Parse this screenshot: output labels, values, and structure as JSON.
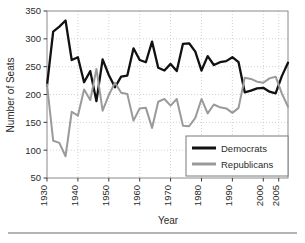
{
  "figure": {
    "plot_left": 47,
    "plot_right": 288,
    "plot_top": 11,
    "plot_bottom": 178,
    "frame_color": "#8a8a8a",
    "grid_color": "#c8c8c8",
    "background": "#ffffff",
    "footer_rule_color": "#6b6b6b"
  },
  "legend": {
    "position": "bottom-right",
    "box_color": "#7a7a7a",
    "entries": [
      {
        "label": "Democrats",
        "color": "#111111",
        "swatch": "line-swatch-democrats"
      },
      {
        "label": "Republicans",
        "color": "#9a9a9a",
        "swatch": "line-swatch-republicans"
      }
    ]
  },
  "chart_data": {
    "type": "line",
    "title": "",
    "xlabel": "Year",
    "ylabel": "Number of Seats",
    "xlim": [
      1930,
      2008
    ],
    "ylim": [
      50,
      350
    ],
    "ytick_step": 50,
    "yticks": [
      50,
      100,
      150,
      200,
      250,
      300,
      350
    ],
    "xticks": [
      1930,
      1940,
      1950,
      1960,
      1970,
      1980,
      1990,
      2000,
      2005
    ],
    "xtick_labels": [
      "1930",
      "1940",
      "1950",
      "1960",
      "1970",
      "1980",
      "1990",
      "2000",
      "2005"
    ],
    "ytick_labels": [
      "50",
      "100",
      "150",
      "200",
      "250",
      "300",
      "350"
    ],
    "grid": true,
    "legend_position": "lower right",
    "x": [
      1930,
      1932,
      1934,
      1936,
      1938,
      1940,
      1942,
      1944,
      1946,
      1948,
      1950,
      1952,
      1954,
      1956,
      1958,
      1960,
      1962,
      1964,
      1966,
      1968,
      1970,
      1972,
      1974,
      1976,
      1978,
      1980,
      1982,
      1984,
      1986,
      1988,
      1990,
      1992,
      1994,
      1996,
      1998,
      2000,
      2002,
      2004,
      2006,
      2008
    ],
    "series": [
      {
        "name": "Democrats",
        "color": "#111111",
        "values": [
          216,
          313,
          322,
          333,
          262,
          267,
          222,
          242,
          188,
          263,
          235,
          213,
          232,
          234,
          283,
          262,
          258,
          295,
          248,
          243,
          255,
          242,
          291,
          292,
          277,
          243,
          269,
          253,
          258,
          260,
          267,
          258,
          204,
          207,
          211,
          212,
          205,
          202,
          233,
          257
        ]
      },
      {
        "name": "Republicans",
        "color": "#9a9a9a",
        "values": [
          218,
          117,
          113,
          89,
          169,
          162,
          209,
          190,
          246,
          171,
          199,
          221,
          203,
          201,
          153,
          175,
          176,
          140,
          187,
          192,
          180,
          192,
          144,
          143,
          158,
          192,
          166,
          182,
          177,
          175,
          167,
          176,
          230,
          228,
          223,
          221,
          229,
          232,
          202,
          178
        ]
      }
    ],
    "annotations": []
  }
}
